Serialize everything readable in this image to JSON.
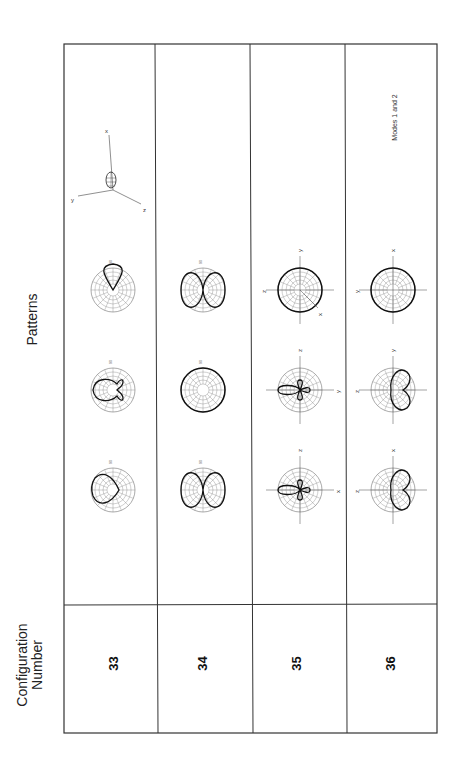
{
  "headers": {
    "patterns": "Patterns",
    "configuration_line1": "Configuration",
    "configuration_line2": "Number"
  },
  "configurations": [
    {
      "number": "33",
      "plots": [
        {
          "axes": [
            "z",
            "y"
          ],
          "ticks": [
            "90",
            "0",
            "180",
            "270"
          ],
          "shape": "narrow-lobe"
        },
        {
          "axes": [
            "x",
            "y"
          ],
          "ticks": [
            "90",
            "0",
            "180",
            "270"
          ],
          "shape": "lobe-with-side-lobes"
        },
        {
          "axes": [
            "x",
            "z"
          ],
          "ticks": [
            "90",
            "0",
            "180",
            "270"
          ],
          "shape": "cardioid"
        }
      ],
      "note": "",
      "inset_axes": [
        "x",
        "y",
        "z"
      ]
    },
    {
      "number": "34",
      "plots": [
        {
          "axes": [
            "z",
            "y"
          ],
          "ticks": [
            "90",
            "0",
            "180",
            "270"
          ],
          "shape": "figure-eight"
        },
        {
          "axes": [
            "z",
            "y"
          ],
          "ticks": [
            "90",
            "0",
            "180",
            "270"
          ],
          "shape": "circle"
        },
        {
          "axes": [
            "z",
            "y"
          ],
          "ticks": [
            "90",
            "0",
            "180",
            "270"
          ],
          "shape": "figure-eight"
        }
      ],
      "note": ""
    },
    {
      "number": "35",
      "plots": [
        {
          "axes": [
            "z",
            "x"
          ],
          "ticks": [],
          "shape": "four-lobe"
        },
        {
          "axes": [
            "z",
            "y"
          ],
          "ticks": [],
          "shape": "four-lobe"
        },
        {
          "axes": [
            "y",
            "z",
            "x"
          ],
          "ticks": [],
          "shape": "circle"
        }
      ],
      "note": ""
    },
    {
      "number": "36",
      "plots": [
        {
          "axes": [
            "x",
            "z"
          ],
          "ticks": [],
          "shape": "half-cardioid"
        },
        {
          "axes": [
            "y",
            "z"
          ],
          "ticks": [],
          "shape": "half-cardioid"
        },
        {
          "axes": [
            "x",
            "y"
          ],
          "ticks": [],
          "shape": "circle"
        }
      ],
      "note": "Modes 1 and 2"
    }
  ]
}
